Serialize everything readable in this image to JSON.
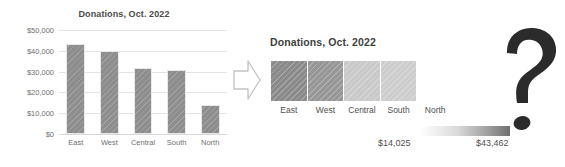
{
  "chart_data": [
    {
      "type": "bar",
      "title": "Donations, Oct. 2022",
      "categories": [
        "East",
        "West",
        "Central",
        "South",
        "North"
      ],
      "values": [
        43462,
        39900,
        31700,
        30900,
        14025
      ],
      "xlabel": "",
      "ylabel": "",
      "ylim": [
        0,
        50000
      ],
      "yticks": [
        "$0",
        "$10,000",
        "$20,000",
        "$30,000",
        "$40,000",
        "$50,000"
      ],
      "ytick_values": [
        0,
        10000,
        20000,
        30000,
        40000,
        50000
      ],
      "grid": true,
      "legend": "none",
      "bar_color": "#8d8d8d"
    },
    {
      "type": "heatmap",
      "title": "Donations, Oct. 2022",
      "categories": [
        "East",
        "West",
        "Central",
        "South",
        "North"
      ],
      "values": [
        43462,
        39900,
        31700,
        30900,
        14025
      ],
      "cell_colors": [
        "#8a8a8a",
        "#969696",
        "#c9c9c9",
        "#cdcdcd",
        "#ffffff"
      ],
      "colorbar": {
        "min_label": "$14,025",
        "max_label": "$43,462",
        "min_value": 14025,
        "max_value": 43462,
        "low_color": "#ffffff",
        "high_color": "#6f6f6f"
      }
    }
  ],
  "bar_chart": {
    "title": "Donations, Oct. 2022",
    "y_axis": {
      "ticks": [
        {
          "label": "$50,000",
          "value": 50000
        },
        {
          "label": "$40,000",
          "value": 40000
        },
        {
          "label": "$30,000",
          "value": 30000
        },
        {
          "label": "$20,000",
          "value": 20000
        },
        {
          "label": "$10,000",
          "value": 10000
        },
        {
          "label": "$0",
          "value": 0
        }
      ]
    },
    "bars": [
      {
        "label": "East",
        "value": 43462
      },
      {
        "label": "West",
        "value": 39900
      },
      {
        "label": "Central",
        "value": 31700
      },
      {
        "label": "South",
        "value": 30900
      },
      {
        "label": "North",
        "value": 14025
      }
    ]
  },
  "arrow": {
    "icon": "arrow-right-outline-icon",
    "fill": "#ffffff",
    "stroke": "#bdbdbd"
  },
  "heatmap": {
    "title": "Donations, Oct. 2022",
    "cells": [
      {
        "label": "East",
        "value": 43462,
        "color": "#8a8a8a"
      },
      {
        "label": "West",
        "value": 39900,
        "color": "#969696"
      },
      {
        "label": "Central",
        "value": 31700,
        "color": "#c9c9c9"
      },
      {
        "label": "South",
        "value": 30900,
        "color": "#cdcdcd"
      },
      {
        "label": "North",
        "value": 14025,
        "color": "#ffffff"
      }
    ],
    "legend": {
      "min_label": "$14,025",
      "max_label": "$43,462"
    }
  },
  "question_mark": {
    "icon": "question-mark-icon",
    "glyph": "?",
    "color": "#2b2b2b"
  }
}
